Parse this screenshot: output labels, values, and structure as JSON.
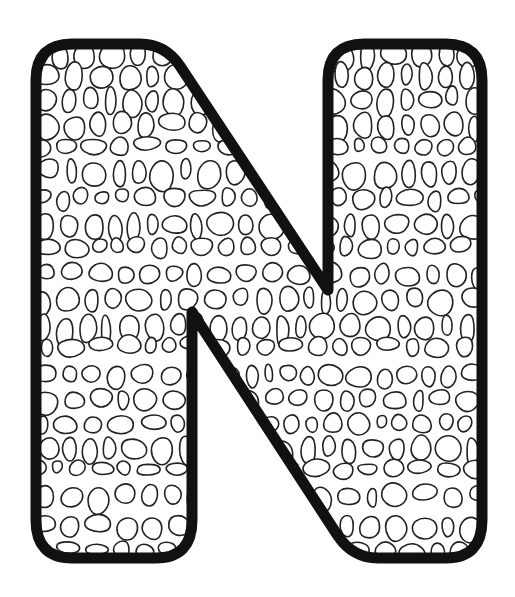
{
  "artwork": {
    "type": "coloring-page",
    "letter": "N",
    "pattern": "crocodile-skin-scales",
    "colors": {
      "background": "#ffffff",
      "outline": "#111111",
      "scale_stroke": "#222222",
      "fill": "#ffffff"
    },
    "outline_width": 11,
    "scale_stroke_width": 1.6
  }
}
